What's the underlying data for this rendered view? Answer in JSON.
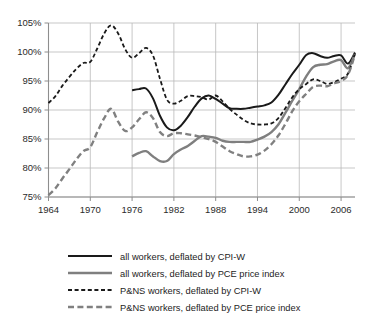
{
  "chart_data": {
    "type": "line",
    "title": "",
    "subtitle": "",
    "xlabel": "",
    "ylabel": "",
    "xlim": [
      1964,
      2008
    ],
    "ylim": [
      75,
      105
    ],
    "grid": true,
    "y_tick_labels": [
      "105%",
      "100%",
      "95%",
      "90%",
      "85%",
      "80%",
      "75%"
    ],
    "y_ticks": [
      105,
      100,
      95,
      90,
      85,
      80,
      75
    ],
    "x_tick_labels": [
      "1964",
      "1970",
      "1976",
      "1982",
      "1988",
      "1994",
      "2000",
      "2006"
    ],
    "x_ticks": [
      1964,
      1970,
      1976,
      1982,
      1988,
      1994,
      2000,
      2006
    ],
    "legend_position": "bottom",
    "series": [
      {
        "name": "all workers, deflated by CPI-W",
        "style": "solid",
        "color": "#1a1a1a",
        "width": 2.0,
        "x": [
          1976,
          1977,
          1978,
          1979,
          1980,
          1981,
          1982,
          1983,
          1984,
          1985,
          1986,
          1987,
          1988,
          1989,
          1990,
          1991,
          1992,
          1993,
          1994,
          1995,
          1996,
          1997,
          1998,
          1999,
          2000,
          2001,
          2002,
          2003,
          2004,
          2005,
          2006,
          2007,
          2008
        ],
        "values": [
          93.4,
          93.6,
          93.7,
          92.0,
          89.0,
          87.0,
          86.5,
          87.3,
          88.8,
          90.6,
          92.0,
          92.5,
          91.9,
          91.1,
          90.3,
          90.2,
          90.2,
          90.4,
          90.6,
          90.8,
          91.3,
          92.6,
          94.4,
          96.2,
          97.8,
          99.5,
          99.8,
          99.3,
          99.0,
          99.3,
          99.4,
          98.0,
          99.9
        ]
      },
      {
        "name": "all workers, deflated by PCE price index",
        "style": "solid",
        "color": "#7f7f7f",
        "width": 2.4,
        "x": [
          1976,
          1977,
          1978,
          1979,
          1980,
          1981,
          1982,
          1983,
          1984,
          1985,
          1986,
          1987,
          1988,
          1989,
          1990,
          1991,
          1992,
          1993,
          1994,
          1995,
          1996,
          1997,
          1998,
          1999,
          2000,
          2001,
          2002,
          2003,
          2004,
          2005,
          2006,
          2007,
          2008
        ],
        "values": [
          82.0,
          82.6,
          82.9,
          82.0,
          81.2,
          81.2,
          82.4,
          83.2,
          83.8,
          84.7,
          85.5,
          85.4,
          85.2,
          84.7,
          84.5,
          84.5,
          84.5,
          84.5,
          84.9,
          85.4,
          86.2,
          87.5,
          89.5,
          91.6,
          93.6,
          95.8,
          97.4,
          97.8,
          97.9,
          98.4,
          98.6,
          97.2,
          99.7
        ]
      },
      {
        "name": "P&NS workers, deflated by CPI-W",
        "style": "dashed-fine",
        "color": "#1a1a1a",
        "width": 1.8,
        "x": [
          1964,
          1965,
          1966,
          1967,
          1968,
          1969,
          1970,
          1971,
          1972,
          1973,
          1974,
          1975,
          1976,
          1977,
          1978,
          1979,
          1980,
          1981,
          1982,
          1983,
          1984,
          1985,
          1986,
          1987,
          1988,
          1989,
          1990,
          1991,
          1992,
          1993,
          1994,
          1995,
          1996,
          1997,
          1998,
          1999,
          2000,
          2001,
          2002,
          2003,
          2004,
          2005,
          2006,
          2007,
          2008
        ],
        "values": [
          91.2,
          92.4,
          94.2,
          95.7,
          97.1,
          98.1,
          98.3,
          100.6,
          103.2,
          104.6,
          103.2,
          100.5,
          99.0,
          99.8,
          100.7,
          99.4,
          95.4,
          91.8,
          91.1,
          91.6,
          92.4,
          92.4,
          92.2,
          91.8,
          92.5,
          91.5,
          90.2,
          89.2,
          88.3,
          87.7,
          87.5,
          87.5,
          87.7,
          88.6,
          90.3,
          92.2,
          93.6,
          94.5,
          95.3,
          95.0,
          94.5,
          94.8,
          95.4,
          96.3,
          99.8
        ]
      },
      {
        "name": "P&NS workers, deflated by PCE price index",
        "style": "dashed-coarse",
        "color": "#808080",
        "width": 2.4,
        "x": [
          1964,
          1965,
          1966,
          1967,
          1968,
          1969,
          1970,
          1971,
          1972,
          1973,
          1974,
          1975,
          1976,
          1977,
          1978,
          1979,
          1980,
          1981,
          1982,
          1983,
          1984,
          1985,
          1986,
          1987,
          1988,
          1989,
          1990,
          1991,
          1992,
          1993,
          1994,
          1995,
          1996,
          1997,
          1998,
          1999,
          2000,
          2001,
          2002,
          2003,
          2004,
          2005,
          2006,
          2007,
          2008
        ],
        "values": [
          75.3,
          76.5,
          78.2,
          79.8,
          81.5,
          82.9,
          83.6,
          86.2,
          88.6,
          90.2,
          88.0,
          86.4,
          87.0,
          88.4,
          89.6,
          88.6,
          86.2,
          85.5,
          86.0,
          86.0,
          85.8,
          85.6,
          85.3,
          85.0,
          84.5,
          83.7,
          82.9,
          82.4,
          82.0,
          82.0,
          82.3,
          83.0,
          84.1,
          85.6,
          87.6,
          89.8,
          91.5,
          92.8,
          94.0,
          94.2,
          94.1,
          94.6,
          95.0,
          96.1,
          99.6
        ]
      }
    ]
  },
  "legend": {
    "items": [
      {
        "label": "all workers, deflated by CPI-W"
      },
      {
        "label": "all workers, deflated by PCE price index"
      },
      {
        "label": "P&NS workers, deflated by CPI-W"
      },
      {
        "label": "P&NS workers, deflated by PCE price index"
      }
    ]
  }
}
